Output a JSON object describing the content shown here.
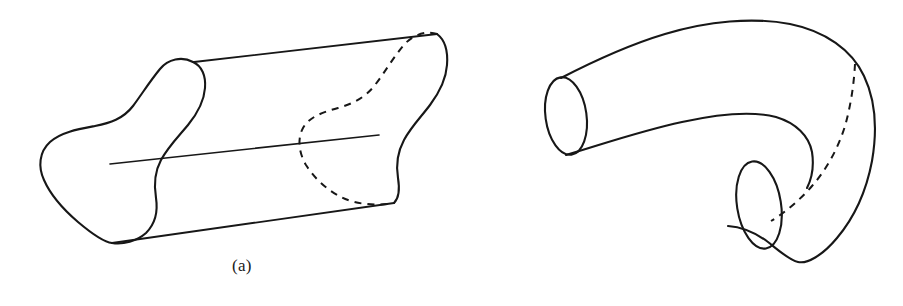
{
  "figure": {
    "background_color": "#ffffff",
    "stroke_color": "#171717",
    "panels": [
      {
        "id": "a",
        "caption": "(a)",
        "description": "solid cylinder over an irregular planar region, drawn as an oblique generalized cylinder with a visible front cross-section, a dashed hidden back cross-section, and a central axis segment"
      },
      {
        "id": "b",
        "caption": "(b)",
        "description": "bent elbow-shaped solid tube with two circular elliptical end faces and a dashed hidden seam curve on the far side"
      }
    ]
  },
  "captions": {
    "a": "(a)",
    "b": "(b)"
  }
}
